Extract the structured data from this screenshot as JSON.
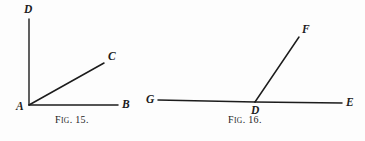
{
  "page": {
    "background_color": "#fdfdfd",
    "ink_color": "#1c1c1c",
    "width": 365,
    "height": 141
  },
  "figures": [
    {
      "id": "fig-15",
      "caption_prefix": "F",
      "caption_smallcaps": "IG",
      "caption_suffix": ". 15.",
      "caption_full": "Fig. 15.",
      "description": "Angle with vertex A, rays to D (vertical), C (oblique), B (horizontal)",
      "points": [
        {
          "name": "A",
          "label": "A",
          "x": 29,
          "y": 105,
          "label_x": 16,
          "label_y": 110
        },
        {
          "name": "B",
          "label": "B",
          "x": 118,
          "y": 105,
          "label_x": 122,
          "label_y": 108
        },
        {
          "name": "C",
          "label": "C",
          "x": 104,
          "y": 63,
          "label_x": 108,
          "label_y": 60
        },
        {
          "name": "D",
          "label": "D",
          "x": 29,
          "y": 19,
          "label_x": 24,
          "label_y": 13
        }
      ],
      "segments": [
        {
          "name": "segment-AD",
          "from": "A",
          "to": "D",
          "x1": 29,
          "y1": 105,
          "x2": 29,
          "y2": 19
        },
        {
          "name": "segment-AC",
          "from": "A",
          "to": "C",
          "x1": 29,
          "y1": 105,
          "x2": 104,
          "y2": 63
        },
        {
          "name": "segment-AB",
          "from": "A",
          "to": "B",
          "x1": 29,
          "y1": 105,
          "x2": 118,
          "y2": 105
        }
      ]
    },
    {
      "id": "fig-16",
      "caption_prefix": "F",
      "caption_smallcaps": "IG",
      "caption_suffix": ". 16.",
      "caption_full": "Fig. 16.",
      "description": "Straight line G-D-E with ray DF rising to the upper right",
      "points": [
        {
          "name": "G",
          "label": "G",
          "x": 158,
          "y": 100,
          "label_x": 146,
          "label_y": 103
        },
        {
          "name": "D",
          "label": "D",
          "x": 255,
          "y": 102,
          "label_x": 251,
          "label_y": 114
        },
        {
          "name": "E",
          "label": "E",
          "x": 342,
          "y": 103,
          "label_x": 346,
          "label_y": 106
        },
        {
          "name": "F",
          "label": "F",
          "x": 299,
          "y": 37,
          "label_x": 302,
          "label_y": 33
        }
      ],
      "segments": [
        {
          "name": "segment-GD",
          "from": "G",
          "to": "D",
          "x1": 158,
          "y1": 100,
          "x2": 255,
          "y2": 102
        },
        {
          "name": "segment-DE",
          "from": "D",
          "to": "E",
          "x1": 255,
          "y1": 102,
          "x2": 342,
          "y2": 103
        },
        {
          "name": "segment-DF",
          "from": "D",
          "to": "F",
          "x1": 255,
          "y1": 102,
          "x2": 299,
          "y2": 37
        }
      ]
    }
  ]
}
